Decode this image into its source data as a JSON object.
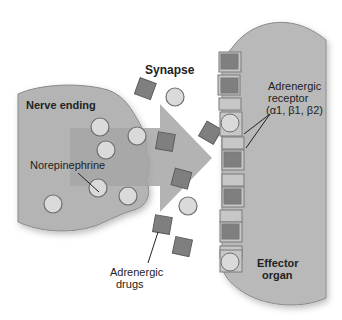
{
  "diagram": {
    "labels": {
      "synapse": "Synapse",
      "nerve_ending": "Nerve ending",
      "norepinephrine": "Norepinephrine",
      "adrenergic_receptor_line1": "Adrenergic",
      "adrenergic_receptor_line2": "receptor",
      "adrenergic_receptor_line3": "(α1, β1, β2)",
      "adrenergic_drugs_line1": "Adrenergic",
      "adrenergic_drugs_line2": "drugs",
      "effector_line1": "Effector",
      "effector_line2": "organ"
    },
    "colors": {
      "membrane": "#b4b4b4",
      "membrane_stroke": "#6e6e6e",
      "vesicle": "#d9d9d9",
      "drug": "#7f7f7f",
      "arrow": "#a9a9a9",
      "receptor": "#c4c4c4"
    }
  }
}
